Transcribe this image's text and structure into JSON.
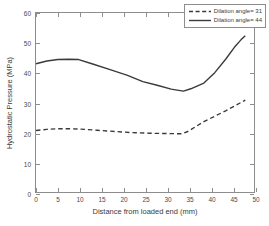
{
  "chart_data": {
    "type": "line",
    "title": "",
    "xlabel": "Distance from loaded end (mm)",
    "ylabel": "Hydrostatic Pressure (MPa)",
    "xlim": [
      0,
      50
    ],
    "ylim": [
      0,
      60
    ],
    "xticks": [
      0,
      5,
      10,
      15,
      20,
      25,
      30,
      35,
      40,
      45,
      50
    ],
    "yticks": [
      0,
      10,
      20,
      30,
      40,
      50,
      60
    ],
    "grid": false,
    "legend_position": "upper right",
    "series": [
      {
        "name": "Dilation angle= 31",
        "style": "dashed",
        "color": "#3a3a3a",
        "points": [
          [
            0,
            20.6
          ],
          [
            2.5,
            21.0
          ],
          [
            5,
            21.2
          ],
          [
            7.5,
            21.2
          ],
          [
            10,
            21.1
          ],
          [
            14,
            20.7
          ],
          [
            18,
            20.3
          ],
          [
            22,
            19.9
          ],
          [
            26,
            19.7
          ],
          [
            30,
            19.6
          ],
          [
            33.5,
            19.5
          ],
          [
            35,
            20.4
          ],
          [
            36.5,
            21.8
          ],
          [
            38.5,
            23.6
          ],
          [
            41,
            25.4
          ],
          [
            43.5,
            27.2
          ],
          [
            45.5,
            28.8
          ],
          [
            47,
            30.0
          ],
          [
            48,
            30.8
          ]
        ]
      },
      {
        "name": "Dilation angle= 44",
        "style": "solid",
        "color": "#3a3a3a",
        "points": [
          [
            0,
            43.0
          ],
          [
            2.5,
            43.9
          ],
          [
            5,
            44.4
          ],
          [
            7.5,
            44.5
          ],
          [
            9.8,
            44.4
          ],
          [
            13,
            42.9
          ],
          [
            17,
            41.0
          ],
          [
            21,
            39.1
          ],
          [
            24.5,
            37.0
          ],
          [
            28,
            35.7
          ],
          [
            31,
            34.5
          ],
          [
            33.8,
            33.8
          ],
          [
            35.5,
            34.6
          ],
          [
            38.5,
            36.5
          ],
          [
            41,
            40.0
          ],
          [
            43.5,
            44.5
          ],
          [
            45.5,
            48.5
          ],
          [
            47,
            51.0
          ],
          [
            48,
            52.4
          ]
        ]
      }
    ]
  },
  "legend": {
    "entries": [
      {
        "label": "Dilation angle= 31"
      },
      {
        "label": "Dilation angle= 44"
      }
    ]
  },
  "axes": {
    "x_title": "Distance from loaded end (mm)",
    "y_title": "Hydrostatic Pressure (MPa)",
    "x_tick_labels": [
      "0",
      "5",
      "10",
      "15",
      "20",
      "25",
      "30",
      "35",
      "40",
      "45",
      "50"
    ],
    "y_tick_labels": [
      "0",
      "10",
      "20",
      "30",
      "40",
      "50",
      "60"
    ]
  },
  "colors": {
    "axis": "#8d8d8d",
    "line": "#3a3a3a",
    "background": "#ffffff"
  }
}
